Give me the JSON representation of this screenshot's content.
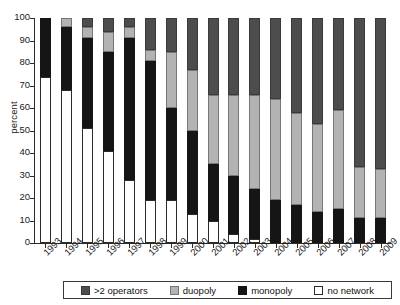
{
  "chart_data": {
    "type": "bar",
    "stacked": true,
    "title": "",
    "subtitle": "",
    "xlabel": "",
    "ylabel": "percent",
    "ylim": [
      0,
      100
    ],
    "y_ticks": [
      0,
      10,
      20,
      30,
      40,
      50,
      60,
      70,
      80,
      90,
      100
    ],
    "grid": false,
    "legend_position": "bottom",
    "categories": [
      "1993",
      "1994",
      "1995",
      "1996",
      "1997",
      "1998",
      "1999",
      "2000",
      "2001",
      "2002",
      "2003",
      "2004",
      "2005",
      "2006",
      "2007",
      "2008",
      "2009"
    ],
    "series": [
      {
        "name": "no network",
        "color": "#ffffff",
        "values": [
          74,
          68,
          51,
          41,
          28,
          19,
          19,
          13,
          10,
          4,
          2,
          0,
          0,
          0,
          0,
          0,
          0
        ]
      },
      {
        "name": "monopoly",
        "color": "#151515",
        "values": [
          26,
          28,
          40,
          44,
          63,
          62,
          41,
          37,
          25,
          26,
          22,
          19,
          17,
          14,
          15,
          11,
          11
        ]
      },
      {
        "name": "duopoly",
        "color": "#b3b3b3",
        "values": [
          0,
          4,
          5,
          9,
          5,
          5,
          25,
          27,
          31,
          36,
          42,
          45,
          41,
          39,
          44,
          23,
          22
        ]
      },
      {
        "name": ">2 operators",
        "color": "#4d4d4d",
        "values": [
          0,
          0,
          4,
          6,
          4,
          14,
          15,
          23,
          34,
          34,
          34,
          36,
          42,
          47,
          41,
          66,
          67
        ]
      }
    ]
  },
  "legend": {
    "items": [
      {
        "label": ">2 operators",
        "swatch": "#4d4d4d",
        "border": "#3a3a3a"
      },
      {
        "label": "duopoly",
        "swatch": "#b3b3b3",
        "border": "#777777"
      },
      {
        "label": "monopoly",
        "swatch": "#151515",
        "border": "#151515"
      },
      {
        "label": "no network",
        "swatch": "#ffffff",
        "border": "#2b2b2b"
      }
    ]
  }
}
